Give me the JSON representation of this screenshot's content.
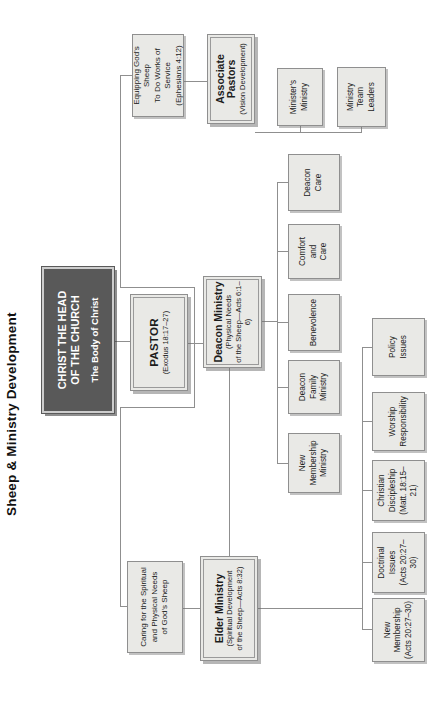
{
  "title": "Sheep & Ministry Development",
  "christ": {
    "line1": "CHRIST THE HEAD",
    "line2": "OF THE CHURCH",
    "subtitle": "The Body of Christ"
  },
  "pastor": {
    "name": "PASTOR",
    "ref": "(Exodus 18:17–27)"
  },
  "caring": {
    "line1": "Caring for the Spiritual",
    "line2": "and Physical Needs",
    "line3": "of God's Sheep"
  },
  "equipping": {
    "line1": "Equipping God's Sheep",
    "line2": "To Do Works of Service",
    "line3": "(Ephesians 4:12)"
  },
  "elder": {
    "name": "Elder Ministry",
    "ref1": "(Spiritual Development",
    "ref2": "of the Sheep—Acts 8:32)"
  },
  "deacon": {
    "name": "Deacon Ministry",
    "ref1": "(Physical Needs",
    "ref2": "of the Sheep—Acts 6:1–6)"
  },
  "associate": {
    "name": "Associate Pastors",
    "ref": "(Vision Development)"
  },
  "elder_children": [
    {
      "lines": [
        "New",
        "Membership",
        "(Acts 20:27–30)"
      ]
    },
    {
      "lines": [
        "Doctrinal",
        "Issues",
        "(Acts 20:27–30)"
      ]
    },
    {
      "lines": [
        "Christian",
        "Discipleship",
        "(Matt. 18:15–21)"
      ]
    },
    {
      "lines": [
        "Worship",
        "Responsibility"
      ]
    },
    {
      "lines": [
        "Policy",
        "Issues"
      ]
    }
  ],
  "deacon_children": [
    {
      "lines": [
        "New",
        "Membership",
        "Ministry"
      ]
    },
    {
      "lines": [
        "Deacon",
        "Family",
        "Ministry"
      ]
    },
    {
      "lines": [
        "Benevolence"
      ]
    },
    {
      "lines": [
        "Comfort",
        "and",
        "Care"
      ]
    },
    {
      "lines": [
        "Deacon",
        "Care"
      ]
    }
  ],
  "associate_children": [
    {
      "lines": [
        "Minister's",
        "Ministry"
      ]
    },
    {
      "lines": [
        "Ministry",
        "Team",
        "Leaders"
      ]
    }
  ],
  "colors": {
    "box_fill": "#e9e9e6",
    "box_border": "#8f8f8f",
    "connector": "#8f8f8f",
    "christ_bg": "#595959",
    "christ_text": "#ffffff"
  }
}
